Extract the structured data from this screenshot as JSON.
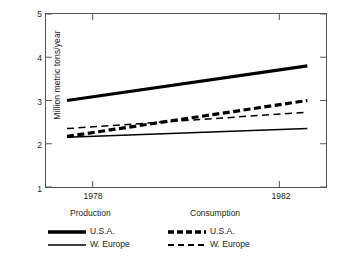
{
  "chart_data": {
    "type": "line",
    "title": "",
    "xlabel": "",
    "ylabel": "Million metric tons/year",
    "xlim": [
      1977.0,
      1983.0
    ],
    "ylim": [
      1,
      5
    ],
    "x_ticks": [
      1978,
      1982
    ],
    "x_tick_labels": [
      "1978",
      "1982"
    ],
    "y_ticks": [
      1,
      2,
      3,
      4,
      5
    ],
    "y_tick_labels": [
      "1",
      "2",
      "3",
      "4",
      "5"
    ],
    "grid": false,
    "legend_position": "below",
    "x": [
      1977.45,
      1982.6
    ],
    "series": [
      {
        "name": "Production U.S.A.",
        "group": "Production",
        "region": "U.S.A.",
        "style": "solid",
        "width": "thick",
        "color": "#000000",
        "values": [
          3.0,
          3.8
        ]
      },
      {
        "name": "Production W. Europe",
        "group": "Production",
        "region": "W. Europe",
        "style": "solid",
        "width": "thin",
        "color": "#000000",
        "values": [
          2.15,
          2.35
        ]
      },
      {
        "name": "Consumption U.S.A.",
        "group": "Consumption",
        "region": "U.S.A.",
        "style": "dashed",
        "width": "thick",
        "color": "#000000",
        "values": [
          2.17,
          3.0
        ]
      },
      {
        "name": "Consumption W. Europe",
        "group": "Consumption",
        "region": "W. Europe",
        "style": "dashed",
        "width": "thin",
        "color": "#000000",
        "values": [
          2.35,
          2.73
        ]
      }
    ]
  },
  "axes": {
    "y_title": "Million metric tons/year",
    "y_tick_labels": [
      "5",
      "4",
      "3",
      "2",
      "1"
    ],
    "y_tick_values": [
      5,
      4,
      3,
      2,
      1
    ],
    "x_tick_labels": [
      "1978",
      "1982"
    ],
    "x_tick_values": [
      1978,
      1982
    ]
  },
  "legend": {
    "groups": [
      {
        "heading": "Production",
        "entries": [
          {
            "label": "U.S.A.",
            "style": "solid-thick"
          },
          {
            "label": "W. Europe",
            "style": "solid-thin"
          }
        ]
      },
      {
        "heading": "Consumption",
        "entries": [
          {
            "label": "U.S.A.",
            "style": "dashed-thick"
          },
          {
            "label": "W. Europe",
            "style": "dashed-thin"
          }
        ]
      }
    ]
  },
  "colors": {
    "line": "#000000",
    "frame": "#555555",
    "text": "#1a1a1a",
    "background": "#ffffff"
  }
}
